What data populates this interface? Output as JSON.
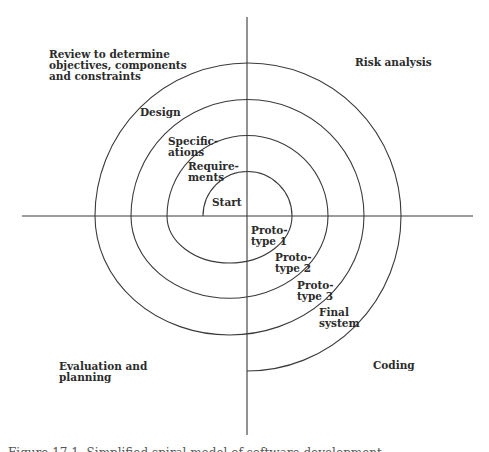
{
  "figure": {
    "caption": "Figure 17.1  Simplified spiral model of software development",
    "line_color": "#3a3a3a",
    "background": "#ffffff"
  },
  "quadrants": {
    "top_left": "Review to determine\nobjectives, components\nand constraints",
    "top_right": "Risk analysis",
    "bottom_left": "Evaluation and\nplanning",
    "bottom_right": "Coding"
  },
  "spiral_labels": {
    "start": "Start",
    "requirements": "Require-\nments",
    "specifications": "Specific-\nations",
    "design": "Design",
    "prototype1": "Proto-\ntype 1",
    "prototype2": "Proto-\ntype 2",
    "prototype3": "Proto-\ntype 3",
    "final_system": "Final\nsystem"
  }
}
